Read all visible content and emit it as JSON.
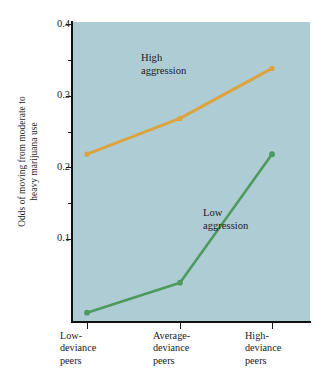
{
  "chart_data": {
    "type": "line",
    "title": "",
    "xlabel": "",
    "ylabel": "Odds of moving from moderate to heavy marijuana use",
    "ylabel_lines": [
      "Odds of moving from moderate to",
      "heavy marijuana use"
    ],
    "categories": [
      "Low-deviance peers",
      "Average-deviance peers",
      "High-deviance peers"
    ],
    "category_lines": [
      [
        "Low-",
        "deviance",
        "peers"
      ],
      [
        "Average-",
        "deviance",
        "peers"
      ],
      [
        "High-",
        "deviance",
        "peers"
      ]
    ],
    "series": [
      {
        "name": "High aggression",
        "values": [
          0.235,
          0.285,
          0.355
        ],
        "color": "#dda33f",
        "label_lines": [
          "High",
          "aggression"
        ]
      },
      {
        "name": "Low aggression",
        "values": [
          0.013,
          0.055,
          0.235
        ],
        "color": "#4d9a5f",
        "label_lines": [
          "Low",
          "aggression"
        ]
      }
    ],
    "ylim": [
      0.0,
      0.42
    ],
    "ytick_major": [
      0.1,
      0.2,
      0.3,
      0.4
    ],
    "ytick_major_labels": [
      "0.1",
      "0.2",
      "0.3",
      "0.4"
    ],
    "ytick_minor": [
      0.15,
      0.25,
      0.35
    ],
    "grid": false,
    "legend": "annotations-inline",
    "plot_background": "#aeccd4",
    "axis_color": "#111111"
  }
}
